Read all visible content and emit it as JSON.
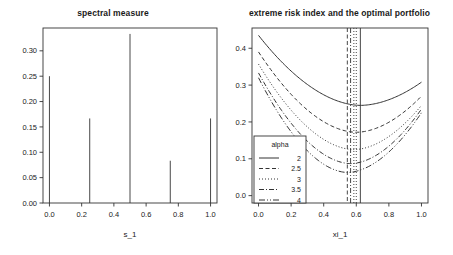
{
  "figure": {
    "background": "#ffffff",
    "foreground": "#333333"
  },
  "chart_data": [
    {
      "type": "bar",
      "panel": "left",
      "title": "spectral measure",
      "xlabel": "s_1",
      "ylabel": "",
      "categories": [
        "0.00",
        "0.25",
        "0.50",
        "0.75",
        "1.00"
      ],
      "x": [
        0.0,
        0.25,
        0.5,
        0.75,
        1.0
      ],
      "values": [
        0.25,
        0.1667,
        0.3333,
        0.0833,
        0.1667
      ],
      "xlim": [
        -0.04,
        1.04
      ],
      "ylim": [
        0.0,
        0.345
      ],
      "xticks": [
        0.0,
        0.2,
        0.4,
        0.6,
        0.8,
        1.0
      ],
      "xticklabels": [
        "0.0",
        "0.2",
        "0.4",
        "0.6",
        "0.8",
        "1.0"
      ],
      "yticks": [
        0.0,
        0.05,
        0.1,
        0.15,
        0.2,
        0.25,
        0.3
      ],
      "yticklabels": [
        "0.00",
        "0.05",
        "0.10",
        "0.15",
        "0.20",
        "0.25",
        "0.30"
      ],
      "grid": false,
      "legend": "none"
    },
    {
      "type": "line",
      "panel": "right",
      "title": "extreme risk index and the optimal portfolio",
      "xlabel": "xi_1",
      "ylabel": "",
      "xlim": [
        -0.04,
        1.04
      ],
      "ylim": [
        -0.02,
        0.455
      ],
      "xticks": [
        0.0,
        0.2,
        0.4,
        0.6,
        0.8,
        1.0
      ],
      "xticklabels": [
        "0.0",
        "0.2",
        "0.4",
        "0.6",
        "0.8",
        "1.0"
      ],
      "yticks": [
        0.0,
        0.1,
        0.2,
        0.3,
        0.4
      ],
      "yticklabels": [
        "0.0",
        "0.1",
        "0.2",
        "0.3",
        "0.4"
      ],
      "grid": false,
      "legend": {
        "position": "bottom-left",
        "title": "alpha",
        "entries": [
          {
            "label": "2",
            "dash": "solid"
          },
          {
            "label": "2.5",
            "dash": "dashed"
          },
          {
            "label": "3",
            "dash": "dotted"
          },
          {
            "label": "3.5",
            "dash": "dashdot"
          },
          {
            "label": "4",
            "dash": "longdashdot"
          }
        ]
      },
      "series": [
        {
          "name": "2",
          "dash": "solid",
          "y_start": 0.435,
          "y_min": 0.245,
          "x_min": 0.625,
          "y_end": 0.308
        },
        {
          "name": "2.5",
          "dash": "dashed",
          "y_start": 0.39,
          "y_min": 0.172,
          "x_min": 0.6,
          "y_end": 0.27
        },
        {
          "name": "3",
          "dash": "dotted",
          "y_start": 0.357,
          "y_min": 0.125,
          "x_min": 0.585,
          "y_end": 0.245
        },
        {
          "name": "3.5",
          "dash": "dashdot",
          "y_start": 0.333,
          "y_min": 0.087,
          "x_min": 0.565,
          "y_end": 0.235
        },
        {
          "name": "4",
          "dash": "longdashdot",
          "y_start": 0.32,
          "y_min": 0.063,
          "x_min": 0.545,
          "y_end": 0.225
        }
      ],
      "optimal_lines": [
        {
          "series": "2",
          "x": 0.625,
          "dash": "solid"
        },
        {
          "series": "2.5",
          "x": 0.6,
          "dash": "dotted"
        },
        {
          "series": "3",
          "x": 0.585,
          "dash": "dotted"
        },
        {
          "series": "3.5",
          "x": 0.565,
          "dash": "dashdot"
        },
        {
          "series": "4",
          "x": 0.545,
          "dash": "dashed"
        }
      ]
    }
  ]
}
